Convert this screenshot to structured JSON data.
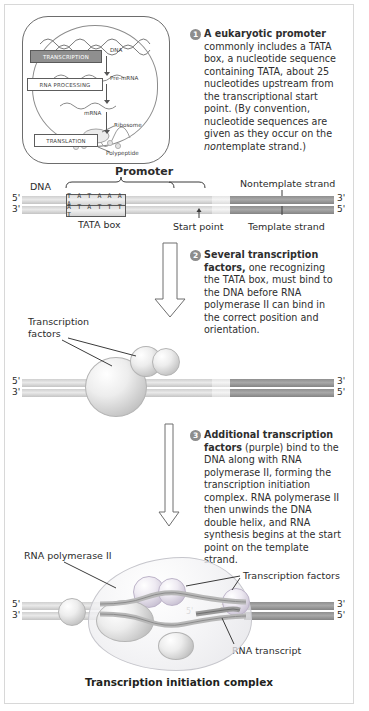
{
  "figure": {
    "caption": "Transcription initiation complex"
  },
  "inset": {
    "stages": [
      {
        "label": "TRANSCRIPTION",
        "active": true
      },
      {
        "label": "RNA PROCESSING",
        "active": false
      },
      {
        "label": "TRANSLATION",
        "active": false
      }
    ],
    "labels": {
      "dna": "DNA",
      "pre_mrna": "Pre-mRNA",
      "mrna": "mRNA",
      "ribosome": "Ribosome",
      "polypeptide": "Polypeptide"
    }
  },
  "steps": [
    {
      "number": "1",
      "lead": "A eukaryotic promoter",
      "text": " commonly includes a TATA box, a nucleotide sequence containing TATA, about 25 nucleotides upstream from the transcriptional start point. (By convention, nucleotide sequences are given as they occur on the ",
      "italic": "non",
      "text2": "template strand.)"
    },
    {
      "number": "2",
      "lead": "Several transcription factors,",
      "text": " one recognizing the TATA box, must bind to the DNA before RNA polymerase II can bind in the correct position and orientation."
    },
    {
      "number": "3",
      "lead": "Additional transcription factors",
      "text": " (purple) bind to the DNA along with RNA polymerase II, forming the transcription initiation complex. RNA polymerase II then unwinds the DNA double helix, and RNA synthesis begins at the start point on the template strand."
    }
  ],
  "panel1": {
    "promoter_label": "Promoter",
    "dna_label": "DNA",
    "nontemplate_label": "Nontemplate strand",
    "template_label": "Template strand",
    "tata_box_label": "TATA box",
    "start_point_label": "Start point",
    "sequence_top": "T A T A A A A",
    "sequence_bottom": "A T A T T T T",
    "end_left_top": "5'",
    "end_left_bottom": "3'",
    "end_right_top": "3'",
    "end_right_bottom": "5'"
  },
  "panel2": {
    "factors_label_line1": "Transcription",
    "factors_label_line2": "factors",
    "end_left_top": "5'",
    "end_left_bottom": "3'",
    "end_right_top": "3'",
    "end_right_bottom": "5'"
  },
  "panel3": {
    "polymerase_label": "RNA polymerase II",
    "factors_label": "Transcription factors",
    "transcript_label": "RNA transcript",
    "end_left_top": "5'",
    "end_left_bottom": "3'",
    "end_right_top": "3'",
    "end_right_bottom": "5'",
    "bubble_five": "5'",
    "bubble_three": "3'"
  },
  "colors": {
    "badge": "#8d8d8d",
    "dna_dark": "#8f8f8f",
    "dna_light": "#cfcfcf",
    "text": "#2b2b2b",
    "purple_factor": "#b4aac2"
  }
}
